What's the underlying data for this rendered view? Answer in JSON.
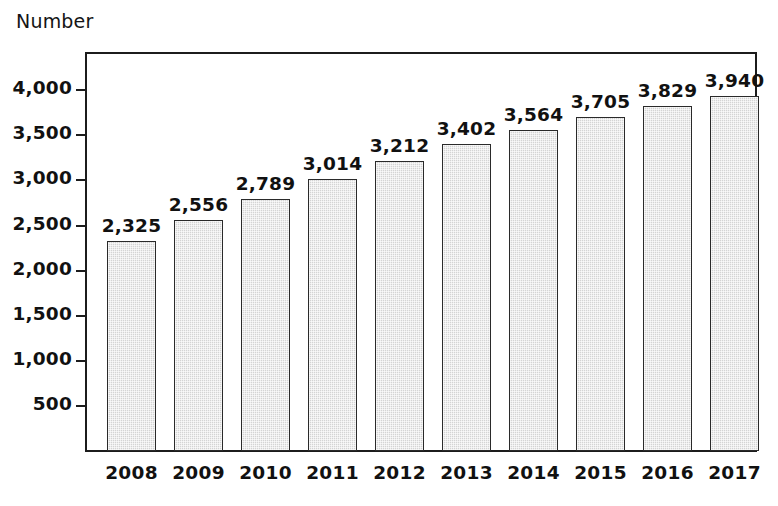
{
  "chart_data": {
    "type": "bar",
    "title": "",
    "ylabel": "Number",
    "xlabel": "",
    "categories": [
      "2008",
      "2009",
      "2010",
      "2011",
      "2012",
      "2013",
      "2014",
      "2015",
      "2016",
      "2017"
    ],
    "values": [
      2325,
      2556,
      2789,
      3014,
      3212,
      3402,
      3564,
      3705,
      3829,
      3940
    ],
    "value_labels": [
      "2,325",
      "2,556",
      "2,789",
      "3,014",
      "3,212",
      "3,402",
      "3,564",
      "3,705",
      "3,829",
      "3,940"
    ],
    "ytick_values": [
      500,
      1000,
      1500,
      2000,
      2500,
      3000,
      3500,
      4000
    ],
    "ytick_labels": [
      "500",
      "1,000",
      "1,500",
      "2,000",
      "2,500",
      "3,000",
      "3,500",
      "4,000"
    ],
    "ylim": [
      0,
      4435
    ],
    "grid": false,
    "legend": false,
    "bar_color": "#d4d4d4",
    "bar_edge_color": "#2a2a2a",
    "background_color": "#ffffff",
    "text_color": "#111111"
  }
}
